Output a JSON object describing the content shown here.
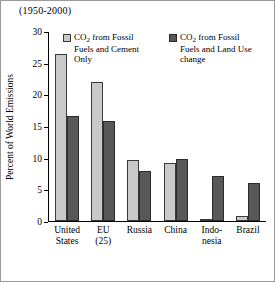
{
  "chart_data": {
    "type": "bar",
    "title": "(1950-2000)",
    "xlabel": "",
    "ylabel": "Percent of World Emissions",
    "ylim": [
      0,
      30
    ],
    "yticks": [
      0,
      5,
      10,
      15,
      20,
      25,
      30
    ],
    "grid": false,
    "legend_position": "top-center",
    "categories": [
      "United States",
      "EU (25)",
      "Russia",
      "China",
      "Indo-nesia",
      "Brazil"
    ],
    "category_lines": [
      [
        "United",
        "States"
      ],
      [
        "EU",
        "(25)"
      ],
      [
        "Russia",
        ""
      ],
      [
        "China",
        ""
      ],
      [
        "Indo-",
        "nesia"
      ],
      [
        "Brazil",
        ""
      ]
    ],
    "series": [
      {
        "name": "CO2 from Fossil Fuels and Cement Only",
        "color": "#c9c9c9",
        "values": [
          26.5,
          22.0,
          9.7,
          9.2,
          0.3,
          0.8
        ]
      },
      {
        "name": "CO2 from Fossil Fuels and Land Use change",
        "color": "#585858",
        "values": [
          16.7,
          15.8,
          8.0,
          9.9,
          7.2,
          6.0
        ]
      }
    ]
  },
  "legend": [
    {
      "swatch": "#c9c9c9",
      "line1_pre": "CO",
      "line1_sub": "2",
      "line1_post": " from Fossil",
      "line2": "Fuels and Cement",
      "line3": "Only"
    },
    {
      "swatch": "#585858",
      "line1_pre": "CO",
      "line1_sub": "2",
      "line1_post": " from Fossil",
      "line2": "Fuels and Land Use",
      "line3": "change"
    }
  ]
}
